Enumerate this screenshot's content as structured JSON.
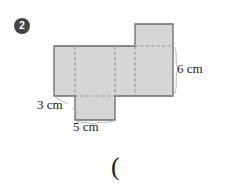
{
  "question": {
    "number": "2"
  },
  "figure": {
    "type": "net-of-rectangular-prism",
    "fill_color": "#d6d6d6",
    "stroke_color": "#6b6b6b",
    "dash_color": "#8f8f8f",
    "leader_color": "#a8a8a8",
    "panels": [
      {
        "name": "band-left-face",
        "x": 54,
        "y": 46,
        "w": 21,
        "h": 50
      },
      {
        "name": "band-second-face",
        "x": 75,
        "y": 46,
        "w": 40,
        "h": 50
      },
      {
        "name": "band-third-face",
        "x": 115,
        "y": 46,
        "w": 20,
        "h": 50
      },
      {
        "name": "band-right-face",
        "x": 135,
        "y": 46,
        "w": 38,
        "h": 50
      },
      {
        "name": "top-flap",
        "x": 135,
        "y": 24,
        "w": 38,
        "h": 22
      },
      {
        "name": "bottom-flap",
        "x": 75,
        "y": 96,
        "w": 40,
        "h": 24
      }
    ],
    "fold_lines": [
      {
        "name": "fold-vertical-1",
        "x1": 75,
        "y1": 46,
        "x2": 75,
        "y2": 96
      },
      {
        "name": "fold-vertical-2",
        "x1": 115,
        "y1": 46,
        "x2": 115,
        "y2": 96
      },
      {
        "name": "fold-vertical-3",
        "x1": 135,
        "y1": 46,
        "x2": 135,
        "y2": 96
      },
      {
        "name": "fold-horizontal-top",
        "x1": 135,
        "y1": 46,
        "x2": 173,
        "y2": 46
      },
      {
        "name": "fold-horizontal-bottom",
        "x1": 75,
        "y1": 96,
        "x2": 115,
        "y2": 96
      }
    ]
  },
  "labels": {
    "height_3cm": "3 cm",
    "width_5cm": "5 cm",
    "depth_6cm": "6 cm"
  },
  "answer_prompt": {
    "text": "("
  }
}
